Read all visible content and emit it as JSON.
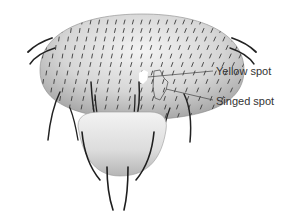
{
  "figure": {
    "labels": [
      {
        "id": "yellow",
        "text": "Yellow spot",
        "x": 216,
        "y": 66
      },
      {
        "id": "singed",
        "text": "Singed spot",
        "x": 216,
        "y": 96
      }
    ],
    "colors": {
      "body_light": "#f2f2f2",
      "body_mid": "#cfcfcf",
      "body_dark": "#9a9a9a",
      "bristle": "#2a2a2a",
      "leader_line": "#444444",
      "text": "#333333",
      "yellow_spot": "#ffffff"
    }
  }
}
